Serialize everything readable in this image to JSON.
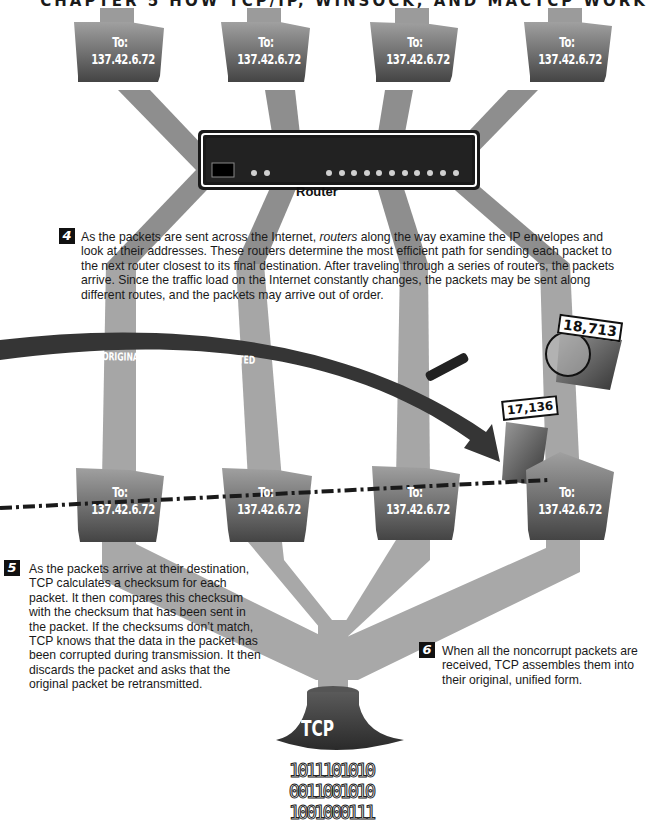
{
  "header": {
    "chapter_title": "CHAPTER 5   HOW TCP/IP, WINSOCK, AND MACTCP WORK"
  },
  "colors": {
    "pipe": "#a8a8a8",
    "pipe_dark": "#8c8c8c",
    "packet_top": "#9a9a9a",
    "packet_bottom": "#4a4a4a",
    "router_body": "#1c1c1c",
    "router_leds": "#cfcfcf",
    "retransmit_arrow": "#3a3a3a",
    "tcp_funnel": "#3c3c3c",
    "dashed_line": "#1a1a1a"
  },
  "top_packets": [
    {
      "to_label": "To:",
      "address": "137.42.6.72"
    },
    {
      "to_label": "To:",
      "address": "137.42.6.72"
    },
    {
      "to_label": "To:",
      "address": "137.42.6.72"
    },
    {
      "to_label": "To:",
      "address": "137.42.6.72"
    }
  ],
  "router": {
    "label": "Router",
    "led_count_left": 2,
    "led_count_right": 11
  },
  "steps": {
    "step4": {
      "number": "4",
      "text_before_italic": "As the packets are sent across the Internet, ",
      "italic": "routers",
      "text_after_italic": " along the way examine the IP envelopes and look at their addresses. These routers determine the most efficient path for sending each packet to the next router closest to its final destination. After traveling through a series of routers, the packets arrive. Since the traffic load on the Internet constantly changes, the packets may be sent along different routes, and the packets may arrive out of order."
    },
    "step5": {
      "number": "5",
      "text": "As the packets arrive at their destination, TCP calculates a checksum for each packet. It then compares this checksum with the checksum that has been sent in the packet. If the checksums don’t match, TCP knows that the data in the packet has been corrupted during transmission. It then discards the packet and asks that the original packet be retransmitted."
    },
    "step6": {
      "number": "6",
      "text": "When all the noncorrupt packets are received, TCP assembles them into their original, unified form."
    }
  },
  "retransmit": {
    "label": "ORIGINAL PACKET RETRANSMITTED"
  },
  "corrupt_packet": {
    "number": "18,713",
    "binary_lines": [
      "0010100101",
      "0100101001",
      "0101001010"
    ]
  },
  "new_packet": {
    "number": "17,136",
    "binary_lines": [
      "1001110010",
      "1101110010",
      "1010001100",
      "1001010010"
    ]
  },
  "bottom_packets": [
    {
      "to_label": "To:",
      "address": "137.42.6.72"
    },
    {
      "to_label": "To:",
      "address": "137.42.6.72"
    },
    {
      "to_label": "To:",
      "address": "137.42.6.72"
    },
    {
      "to_label": "To:",
      "address": "137.42.6.72"
    }
  ],
  "tcp": {
    "label": "TCP",
    "output_binary": [
      "1011101010",
      "0011001010",
      "1001000111"
    ]
  }
}
